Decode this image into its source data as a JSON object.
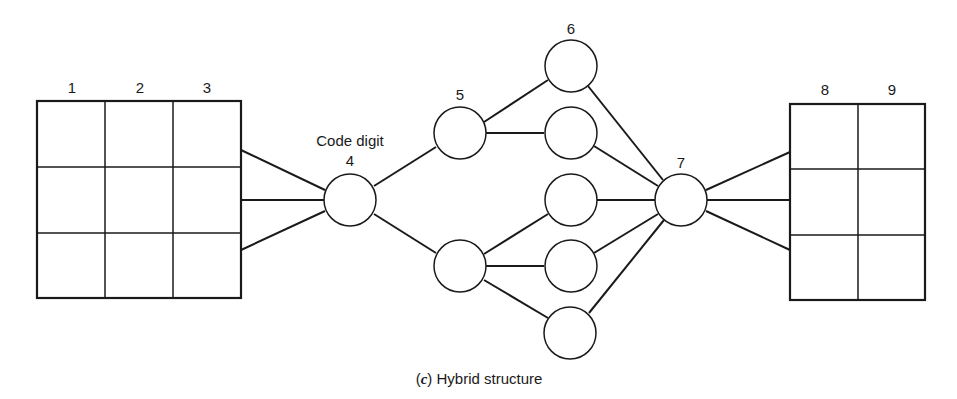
{
  "figure": {
    "caption_prefix": "(",
    "caption_letter": "c",
    "caption_suffix": ") Hybrid structure",
    "line_color": "#1a1a1a"
  },
  "left_grid": {
    "column_labels": [
      "1",
      "2",
      "3"
    ],
    "rows": 3,
    "cols": 3
  },
  "right_grid": {
    "column_labels": [
      "8",
      "9"
    ],
    "rows": 3,
    "cols": 2
  },
  "nodes": {
    "code_digit_label": "Code digit",
    "n4": "4",
    "n5": "5",
    "n6": "6",
    "n7": "7"
  }
}
